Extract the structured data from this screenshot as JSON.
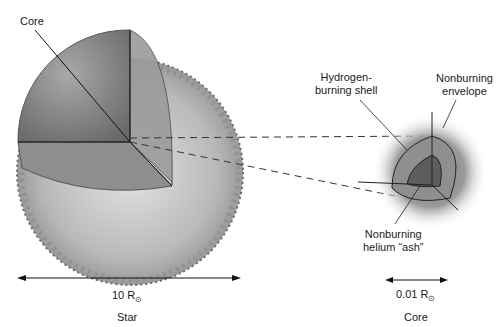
{
  "diagram": {
    "star": {
      "label": "Star",
      "core_label": "Core",
      "scale_value": "10 R",
      "scale_unit_symbol": "⊙"
    },
    "core_detail": {
      "label": "Core",
      "scale_value": "0.01 R",
      "scale_unit_symbol": "⊙",
      "annotations": {
        "hydrogen_shell_line1": "Hydrogen-",
        "hydrogen_shell_line2": "burning shell",
        "envelope_line1": "Nonburning",
        "envelope_line2": "envelope",
        "helium_ash_line1": "Nonburning",
        "helium_ash_line2": "helium “ash”"
      }
    },
    "colors": {
      "star_surface": "#8a8a8a",
      "star_inner": "#6e6e6e",
      "envelope_light": "#c9c9c9",
      "core_dark": "#5a5a5a",
      "lines": "#1a1a1a"
    }
  }
}
